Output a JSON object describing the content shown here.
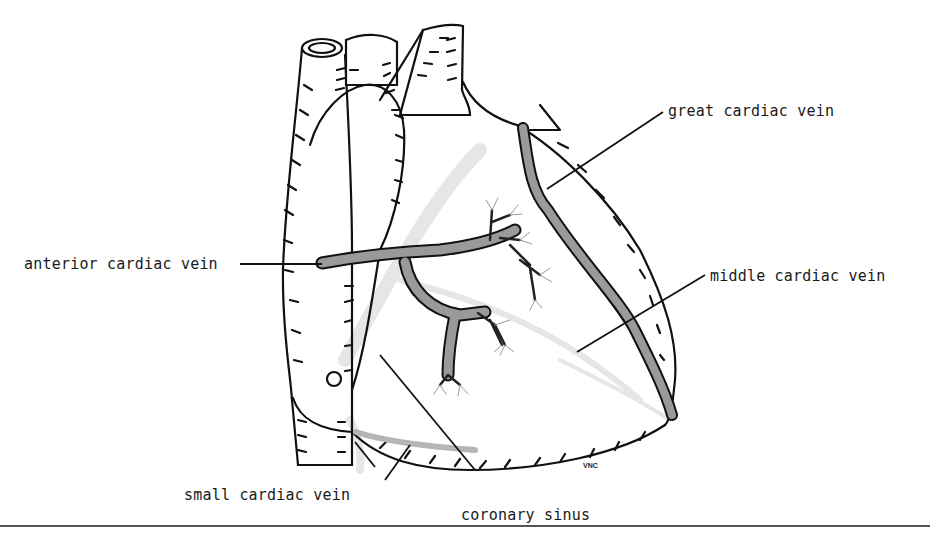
{
  "figure": {
    "labels": {
      "anterior_cardiac_vein": "anterior cardiac vein",
      "great_cardiac_vein": "great cardiac vein",
      "middle_cardiac_vein": "middle cardiac vein",
      "small_cardiac_vein": "small cardiac vein",
      "coronary_sinus": "coronary sinus"
    },
    "signature": "VNC",
    "colors": {
      "outline": "#111111",
      "vein_fill": "#9a9a9a",
      "hidden_vessel": "#e4e4e4",
      "background": "#ffffff"
    }
  }
}
